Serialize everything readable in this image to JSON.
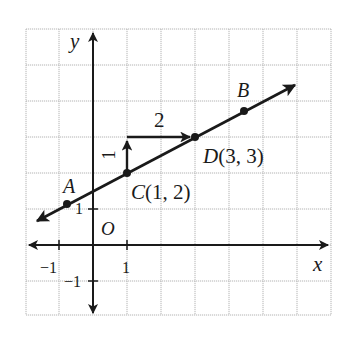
{
  "figure": {
    "type": "coordinate-plane-line",
    "grid": {
      "x_min": -2,
      "x_max": 7,
      "y_min": -2,
      "y_max": 6,
      "origin_px": [
        93,
        245
      ],
      "unit_px_x": 33.9,
      "unit_px_y": 36
    },
    "axes": {
      "x_label": "x",
      "y_label": "y",
      "origin_label": "O",
      "x_ticks": [
        {
          "value": -1,
          "label": "−1"
        },
        {
          "value": 1,
          "label": "1"
        }
      ],
      "y_ticks": [
        {
          "value": 1,
          "label": "1"
        },
        {
          "value": -1,
          "label": "−1"
        }
      ]
    },
    "line": {
      "slope": 0.5,
      "intercept": 1.5,
      "equation": "y = 0.5x + 1.5"
    },
    "points": [
      {
        "name": "A",
        "label": "A",
        "x": -0.75,
        "y": 1.125
      },
      {
        "name": "C",
        "label": "C(1, 2)",
        "x": 1,
        "y": 2
      },
      {
        "name": "D",
        "label": "D(3, 3)",
        "x": 3,
        "y": 3
      },
      {
        "name": "B",
        "label": "B",
        "x": 4.5,
        "y": 3.75
      }
    ],
    "slope_triangle": {
      "rise": 1,
      "run": 2,
      "rise_label": "1",
      "run_label": "2"
    },
    "colors": {
      "ink": "#1a1a1a",
      "grid": "#b4b4b4",
      "background": "#ffffff"
    }
  }
}
